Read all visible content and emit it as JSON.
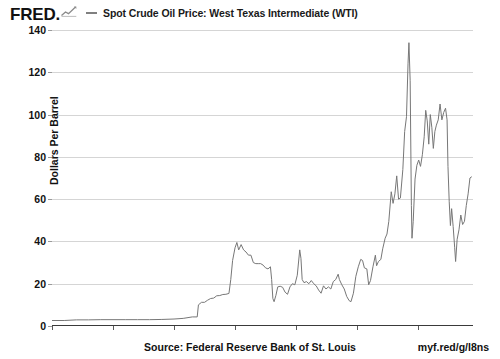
{
  "branding": {
    "wordmark": "FRED.",
    "logo_icon": "fred-chart-logo"
  },
  "legend": {
    "items": [
      {
        "label": "Spot Crude Oil Price: West Texas Intermediate (WTI)",
        "color": "#808080"
      }
    ]
  },
  "footer": {
    "source": "Source: Federal Reserve Bank of St. Louis",
    "short_url": "myf.red/g/l8ns"
  },
  "colors": {
    "line": "#777777",
    "grid": "#d5d5d5",
    "axis": "#3a3a3a",
    "text": "#111111"
  },
  "chart_data": {
    "type": "line",
    "title": "Spot Crude Oil Price: West Texas Intermediate (WTI)",
    "xlabel": "",
    "ylabel": "Dollars Per Barrel",
    "grid": true,
    "legend_position": "top",
    "xlim": [
      1950,
      2019
    ],
    "ylim": [
      0,
      140
    ],
    "yticks": [
      0,
      20,
      40,
      60,
      80,
      100,
      120,
      140
    ],
    "xticks": [
      1950,
      1960,
      1970,
      1980,
      1990,
      2000,
      2010
    ],
    "ytick_labels": [
      "0",
      "20",
      "40",
      "60",
      "80",
      "100",
      "120",
      "140"
    ],
    "xtick_labels": [
      "1950",
      "1960",
      "1970",
      "1980",
      "1990",
      "2000",
      "2010"
    ],
    "series": [
      {
        "name": "Spot Crude Oil Price: West Texas Intermediate (WTI)",
        "color": "#777777",
        "x": [
          1950.0,
          1952.0,
          1954.0,
          1956.0,
          1958.0,
          1960.0,
          1962.0,
          1964.0,
          1966.0,
          1968.0,
          1970.0,
          1971.5,
          1973.0,
          1973.8,
          1974.0,
          1974.5,
          1975.0,
          1975.5,
          1976.0,
          1976.5,
          1977.0,
          1977.5,
          1978.0,
          1978.5,
          1979.0,
          1979.3,
          1979.6,
          1980.0,
          1980.3,
          1980.6,
          1981.0,
          1981.4,
          1981.8,
          1982.2,
          1982.6,
          1983.0,
          1983.4,
          1983.8,
          1984.2,
          1984.6,
          1985.0,
          1985.4,
          1985.8,
          1986.0,
          1986.2,
          1986.4,
          1986.7,
          1987.0,
          1987.4,
          1987.8,
          1988.2,
          1988.6,
          1989.0,
          1989.4,
          1989.8,
          1990.2,
          1990.6,
          1990.8,
          1991.0,
          1991.3,
          1991.7,
          1992.1,
          1992.5,
          1992.9,
          1993.3,
          1993.7,
          1994.1,
          1994.5,
          1994.9,
          1995.3,
          1995.7,
          1996.1,
          1996.5,
          1996.9,
          1997.1,
          1997.5,
          1997.9,
          1998.3,
          1998.7,
          1999.0,
          1999.4,
          1999.8,
          2000.2,
          2000.6,
          2000.9,
          2001.2,
          2001.6,
          2001.9,
          2002.2,
          2002.6,
          2003.0,
          2003.2,
          2003.5,
          2003.9,
          2004.2,
          2004.6,
          2004.9,
          2005.2,
          2005.6,
          2005.9,
          2006.2,
          2006.5,
          2006.8,
          2007.1,
          2007.5,
          2007.8,
          2008.1,
          2008.35,
          2008.5,
          2008.7,
          2008.9,
          2009.0,
          2009.2,
          2009.5,
          2009.8,
          2010.1,
          2010.4,
          2010.7,
          2011.0,
          2011.25,
          2011.5,
          2011.75,
          2012.0,
          2012.25,
          2012.5,
          2012.75,
          2013.0,
          2013.3,
          2013.6,
          2013.9,
          2014.2,
          2014.5,
          2014.75,
          2014.9,
          2015.1,
          2015.3,
          2015.5,
          2015.75,
          2016.0,
          2016.15,
          2016.4,
          2016.7,
          2017.0,
          2017.3,
          2017.6,
          2017.9,
          2018.2,
          2018.5,
          2018.75
        ],
        "y": [
          2.6,
          2.6,
          2.9,
          2.9,
          3.0,
          3.0,
          3.0,
          3.0,
          3.0,
          3.1,
          3.3,
          3.6,
          4.3,
          4.3,
          10.0,
          11.2,
          11.2,
          12.2,
          13.0,
          13.2,
          14.3,
          14.4,
          14.9,
          15.0,
          15.4,
          22.0,
          31.0,
          37.0,
          39.5,
          36.0,
          38.5,
          36.0,
          35.0,
          33.5,
          33.5,
          30.0,
          29.5,
          29.5,
          29.5,
          28.8,
          27.5,
          27.0,
          28.0,
          22.0,
          13.0,
          11.5,
          14.5,
          18.5,
          18.8,
          18.3,
          16.0,
          15.0,
          18.5,
          20.0,
          19.5,
          24.0,
          36.0,
          32.0,
          22.0,
          20.5,
          21.0,
          20.0,
          21.5,
          20.0,
          19.0,
          17.0,
          15.5,
          19.0,
          17.5,
          18.5,
          17.5,
          21.0,
          22.0,
          24.5,
          22.0,
          19.5,
          17.5,
          14.0,
          12.0,
          11.5,
          15.5,
          23.5,
          28.0,
          31.5,
          31.0,
          27.5,
          27.0,
          19.5,
          21.5,
          28.0,
          33.5,
          28.5,
          30.5,
          31.5,
          36.5,
          41.5,
          43.5,
          49.5,
          63.5,
          58.0,
          62.5,
          71.0,
          60.0,
          60.5,
          74.0,
          92.0,
          99.0,
          124.0,
          134.0,
          116.0,
          57.0,
          41.5,
          49.5,
          69.5,
          76.0,
          78.5,
          75.5,
          81.0,
          89.5,
          102.0,
          97.0,
          86.0,
          100.0,
          94.0,
          84.0,
          92.0,
          95.0,
          97.5,
          105.0,
          97.5,
          101.0,
          103.0,
          97.5,
          75.5,
          59.0,
          47.5,
          55.5,
          47.0,
          37.0,
          30.5,
          41.0,
          45.5,
          52.5,
          48.0,
          49.5,
          57.0,
          62.5,
          70.0,
          70.5
        ]
      }
    ]
  }
}
